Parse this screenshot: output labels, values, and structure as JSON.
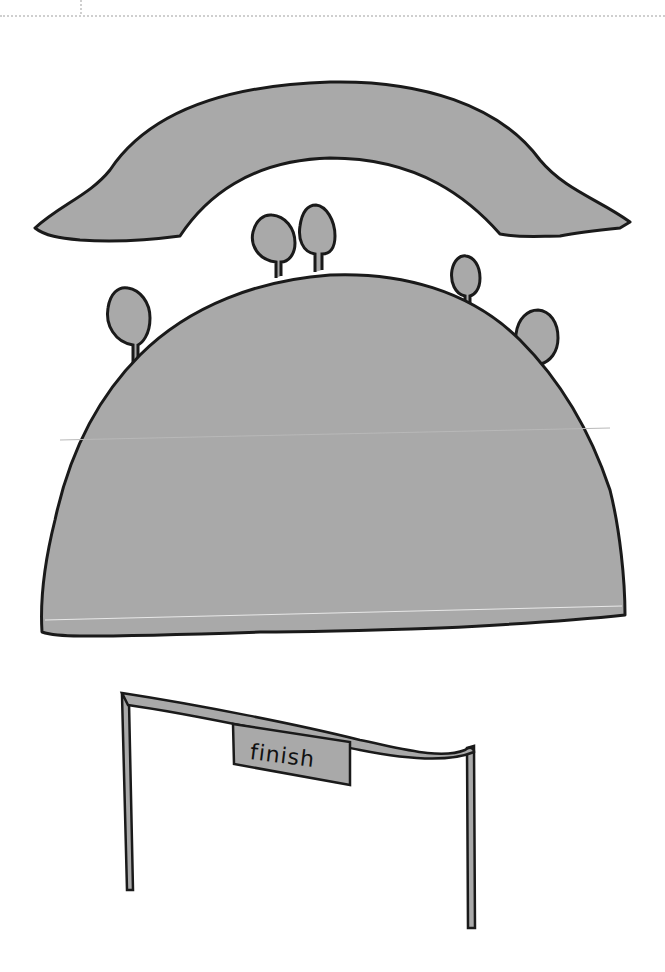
{
  "sheet": {
    "guides": {
      "horizontal_dotted_line": true,
      "vertical_dotted_tick": true
    }
  },
  "pieces": [
    {
      "name": "arch-cloud",
      "description": "grey arched hill piece"
    },
    {
      "name": "big-hill",
      "description": "grey dome hill with trees"
    },
    {
      "name": "finish-banner",
      "description": "finish line gate with banner"
    }
  ],
  "banner": {
    "text": "finish"
  },
  "colors": {
    "fill": "#a9a9a9",
    "outline": "#1a1a1a",
    "background": "#ffffff"
  }
}
